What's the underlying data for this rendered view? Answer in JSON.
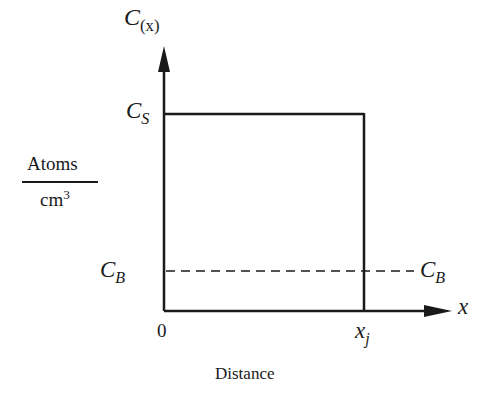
{
  "diagram": {
    "y_axis": {
      "label_main": "C",
      "label_sub": "(x)"
    },
    "x_axis": {
      "label": "x",
      "caption": "Distance"
    },
    "y_unit": {
      "numerator": "Atoms",
      "denominator_base": "cm",
      "denominator_exp": "3"
    },
    "levels": {
      "surface": {
        "main": "C",
        "sub": "S"
      },
      "background": {
        "main": "C",
        "sub": "B"
      },
      "background_right": {
        "main": "C",
        "sub": "B"
      }
    },
    "ticks": {
      "origin": "0",
      "junction_main": "x",
      "junction_sub": "j"
    },
    "colors": {
      "ink": "#1a1a1a",
      "background": "#ffffff"
    }
  }
}
